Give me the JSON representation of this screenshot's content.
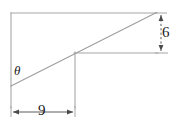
{
  "figure": {
    "kind": "right-triangle-dimension-diagram",
    "stroke_color": "#9a9a9a",
    "dim_stroke_color": "#555555",
    "text_color": "#1a1a1a",
    "background": "#ffffff",
    "angle_label": "θ",
    "base_label": "9",
    "height_label": "6",
    "labels": {
      "angle": "θ",
      "base": "9",
      "height": "6"
    },
    "geometry": {
      "top_line": {
        "x1": 11,
        "y1": 13,
        "x2": 157,
        "y2": 13
      },
      "left_line": {
        "x1": 11,
        "y1": 13,
        "x2": 11,
        "y2": 108
      },
      "mid_line": {
        "x1": 74,
        "y1": 53,
        "x2": 157,
        "y2": 53
      },
      "inner_vertical": {
        "x1": 75,
        "y1": 52,
        "x2": 75,
        "y2": 108
      },
      "hypotenuse": {
        "x1": 11,
        "y1": 86,
        "x2": 156,
        "y2": 13
      }
    },
    "dimensions": {
      "base": {
        "value": "9",
        "line": {
          "x1": 12,
          "y1": 112,
          "x2": 75,
          "y2": 112
        },
        "extension_left_x": 11,
        "extension_right_x": 75,
        "arrows": "both"
      },
      "height": {
        "value": "6",
        "line": {
          "x1": 161,
          "y1": 14,
          "x2": 161,
          "y2": 52
        },
        "extension_top_y": 13,
        "extension_bottom_y": 53,
        "arrows": "both"
      }
    }
  }
}
